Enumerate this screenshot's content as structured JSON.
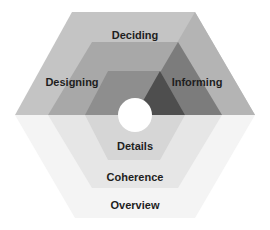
{
  "diagram": {
    "labels": {
      "deciding": "Deciding",
      "designing": "Designing",
      "informing": "Informing",
      "details": "Details",
      "coherence": "Coherence",
      "overview": "Overview"
    },
    "colors": {
      "outer_top": "#c4c4c4",
      "middle_top": "#a8a8a8",
      "inner_top": "#8e8e8e",
      "informing_outer": "#b4b4b4",
      "informing_middle": "#7c7c7c",
      "informing_inner": "#4e4e4e",
      "outer_bottom": "#f4f4f4",
      "middle_bottom": "#e6e6e6",
      "inner_bottom": "#d6d6d6",
      "center": "#ffffff"
    }
  }
}
